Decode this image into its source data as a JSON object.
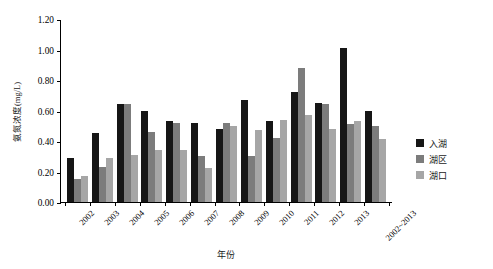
{
  "chart_data": {
    "type": "bar",
    "title": "",
    "xlabel": "年份",
    "ylabel": "氨氮浓度(mg/L)",
    "ylim": [
      0.0,
      1.2
    ],
    "yticks": [
      "0.00",
      "0.20",
      "0.40",
      "0.60",
      "0.80",
      "1.00",
      "1.20"
    ],
    "ytick_values": [
      0.0,
      0.2,
      0.4,
      0.6,
      0.8,
      1.0,
      1.2
    ],
    "grid": false,
    "legend_position": "right",
    "categories": [
      "2002",
      "2003",
      "2004",
      "2005",
      "2006",
      "2007",
      "2008",
      "2009",
      "2010",
      "2011",
      "2012",
      "2013",
      "2002~2013"
    ],
    "series": [
      {
        "name": "入湖",
        "color": "#161616",
        "values": [
          0.29,
          0.45,
          0.64,
          0.6,
          0.53,
          0.52,
          0.48,
          0.67,
          0.53,
          0.72,
          0.65,
          1.01,
          0.6
        ]
      },
      {
        "name": "湖区",
        "color": "#7c7c7c",
        "values": [
          0.15,
          0.23,
          0.64,
          0.46,
          0.52,
          0.3,
          0.52,
          0.3,
          0.42,
          0.88,
          0.64,
          0.51,
          0.5
        ]
      },
      {
        "name": "湖口",
        "color": "#a6a6a6",
        "values": [
          0.17,
          0.29,
          0.31,
          0.34,
          0.34,
          0.22,
          0.5,
          0.47,
          0.54,
          0.57,
          0.48,
          0.53,
          0.41
        ]
      }
    ]
  }
}
